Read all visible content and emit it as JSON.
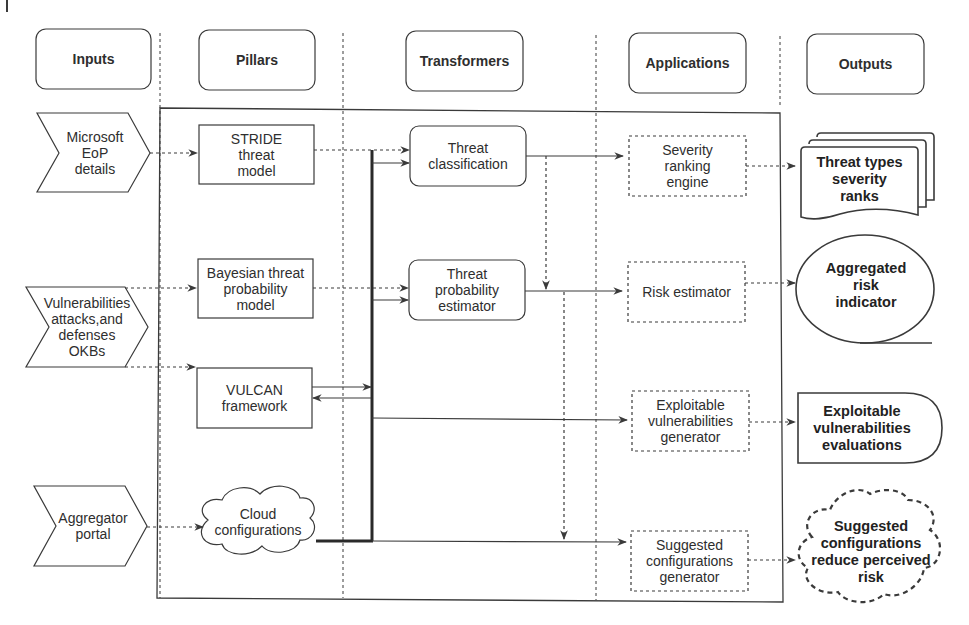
{
  "lanes": {
    "inputs": "Inputs",
    "pillars": "Pillars",
    "transformers": "Transformers",
    "applications": "Applications",
    "outputs": "Outputs"
  },
  "inputs": {
    "microsoft_eop": [
      "Microsoft",
      "EoP",
      "details"
    ],
    "vuln_okbs": [
      "Vulnerabilities",
      "attacks,and",
      "defenses",
      "OKBs"
    ],
    "aggregator": [
      "Aggregator",
      "portal"
    ]
  },
  "pillars": {
    "stride": [
      "STRIDE",
      "threat",
      "model"
    ],
    "bayesian": [
      "Bayesian threat",
      "probability",
      "model"
    ],
    "vulcan": [
      "VULCAN",
      "framework"
    ],
    "cloud": [
      "Cloud",
      "configurations"
    ]
  },
  "transformers": {
    "threat_classification": [
      "Threat",
      "classification"
    ],
    "threat_probability": [
      "Threat",
      "probability",
      "estimator"
    ]
  },
  "applications": {
    "severity_ranking": [
      "Severity",
      "ranking",
      "engine"
    ],
    "risk_estimator": [
      "Risk estimator"
    ],
    "exploitable_generator": [
      "Exploitable",
      "vulnerabilities",
      "generator"
    ],
    "suggested_generator": [
      "Suggested",
      "configurations",
      "generator"
    ]
  },
  "outputs": {
    "threat_types": [
      "Threat types",
      "severity",
      "ranks"
    ],
    "aggregated_risk": [
      "Aggregated",
      "risk",
      "indicator"
    ],
    "exploitable_evaluations": [
      "Exploitable",
      "vulnerabilities",
      "evaluations"
    ],
    "suggested_configs": [
      "Suggested",
      "configurations",
      "reduce perceived",
      "risk"
    ]
  },
  "colors": {
    "stroke": "#3a3a3a",
    "background": "#ffffff",
    "text": "#2e2e2e"
  }
}
